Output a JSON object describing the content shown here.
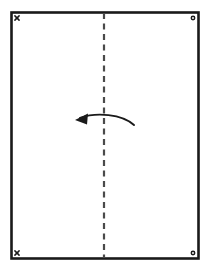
{
  "canvas": {
    "width": 211,
    "height": 273,
    "background_color": "#ffffff",
    "title": "Paper fold diagram"
  },
  "sheet": {
    "name": "paper-sheet",
    "x": 11.5,
    "y": 12.5,
    "width": 187,
    "height": 246,
    "fill_color": "#ffffff",
    "stroke_color": "#1a1a1a",
    "stroke_width": 2.6
  },
  "fold_line": {
    "name": "vertical-fold-line",
    "orientation": "vertical",
    "x": 104,
    "y_start": 13,
    "y_end": 258,
    "style": "dashed",
    "dash_length": 6,
    "gap_length": 4.5,
    "stroke_color": "#4a4a4a",
    "stroke_width": 2.2
  },
  "fold_arrow": {
    "name": "fold-direction-arrow",
    "direction": "right-to-left",
    "description": "Curved arrow indicating the right half folds over to the left",
    "path": "M 134 125 C 122 114, 96 112, 80 118",
    "tip_x": 75,
    "tip_y": 120,
    "head_points": "75,120 88,113.5 87,124.5",
    "stroke_color": "#1a1a1a",
    "stroke_width": 1.9
  },
  "corner_markers": [
    {
      "name": "corner-marker-top-left",
      "symbol": "x",
      "label": "x",
      "cx": 17,
      "cy": 18,
      "size": 4.2,
      "color": "#1a1a1a"
    },
    {
      "name": "corner-marker-top-right",
      "symbol": "circle",
      "label": "o",
      "cx": 193,
      "cy": 18,
      "size": 3.4,
      "color": "#1a1a1a"
    },
    {
      "name": "corner-marker-bottom-left",
      "symbol": "x",
      "label": "x",
      "cx": 17,
      "cy": 253,
      "size": 4.2,
      "color": "#1a1a1a"
    },
    {
      "name": "corner-marker-bottom-right",
      "symbol": "circle",
      "label": "o",
      "cx": 193,
      "cy": 253,
      "size": 3.4,
      "color": "#1a1a1a"
    }
  ]
}
